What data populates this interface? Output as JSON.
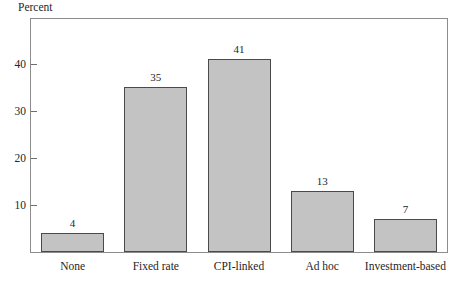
{
  "chart_data": {
    "type": "bar",
    "title": "",
    "subtitle": "",
    "xlabel": "",
    "ylabel": "Percent",
    "categories": [
      "None",
      "Fixed rate",
      "CPI-linked",
      "Ad hoc",
      "Investment-based"
    ],
    "values": [
      4,
      35,
      41,
      13,
      7
    ],
    "value_labels": [
      "4",
      "35",
      "41",
      "13",
      "7"
    ],
    "ylim": [
      0,
      49.5
    ],
    "yticks": [
      10,
      20,
      30,
      40
    ],
    "ytick_labels": [
      "10",
      "20",
      "30",
      "40"
    ],
    "grid": false,
    "legend": null,
    "legend_position": "none",
    "bar_fill_color": "#c3c3c3",
    "bar_border_color": "#4a4a4a",
    "frame_color": "#8c8c8c",
    "text_color": "#262626"
  }
}
